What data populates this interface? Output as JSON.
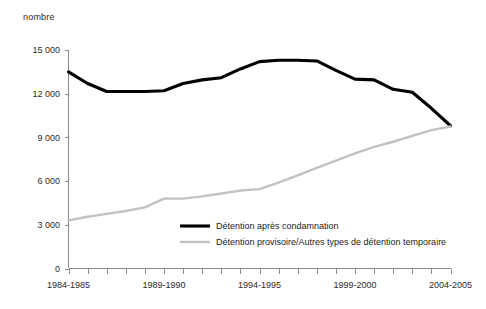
{
  "chart_data": {
    "type": "line",
    "title": "",
    "subtitle": "",
    "xlabel": "",
    "ylabel": "nombre",
    "ylim": [
      0,
      15000
    ],
    "grid": false,
    "legend_position": "inside-center-bottom",
    "x": [
      "1984-1985",
      "1985-1986",
      "1986-1987",
      "1987-1988",
      "1988-1989",
      "1989-1990",
      "1990-1991",
      "1991-1992",
      "1992-1993",
      "1993-1994",
      "1994-1995",
      "1995-1996",
      "1996-1997",
      "1997-1998",
      "1998-1999",
      "1999-2000",
      "2000-2001",
      "2001-2002",
      "2002-2003",
      "2003-2004",
      "2004-2005"
    ],
    "xtick_labels": [
      "1984-1985",
      "1989-1990",
      "1994-1995",
      "1999-2000",
      "2004-2005"
    ],
    "xtick_label_indices": [
      0,
      5,
      10,
      15,
      20
    ],
    "ytick_labels": [
      "0",
      "3 000",
      "6 000",
      "9 000",
      "12 000",
      "15 000"
    ],
    "ytick_values": [
      0,
      3000,
      6000,
      9000,
      12000,
      15000
    ],
    "series": [
      {
        "name": "Détention après condamnation",
        "color": "#000000",
        "width": 3.1,
        "values": [
          13500,
          12700,
          12150,
          12150,
          12150,
          12200,
          12700,
          12950,
          13100,
          13700,
          14200,
          14300,
          14300,
          14250,
          13600,
          13000,
          12950,
          12300,
          12100,
          11000,
          9800
        ]
      },
      {
        "name": "Détention provisoire/Autres types de détention temporaire",
        "color": "#c2c2c2",
        "width": 2.4,
        "values": [
          3300,
          3550,
          3750,
          3950,
          4200,
          4800,
          4800,
          4950,
          5150,
          5350,
          5450,
          5900,
          6400,
          6900,
          7400,
          7900,
          8350,
          8700,
          9100,
          9500,
          9750
        ]
      }
    ]
  },
  "legend": {
    "entries": [
      {
        "label": "Détention après condamnation",
        "color": "#000000"
      },
      {
        "label": "Détention provisoire/Autres types de détention temporaire",
        "color": "#c2c2c2"
      }
    ]
  }
}
